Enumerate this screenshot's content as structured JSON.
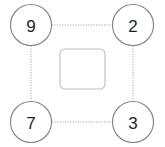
{
  "canvas": {
    "width": 165,
    "height": 147,
    "background": "#ffffff"
  },
  "diagram": {
    "type": "node-link-diagram",
    "title": "",
    "layout": "four-corner-ring",
    "colors": {
      "node_stroke": "#808080",
      "node_fill": "#ffffff",
      "node_text": "#1f1f1f",
      "edge_stroke": "#9a9a9a",
      "center_box_stroke": "#bdbdbd",
      "center_box_fill": "#ffffff"
    },
    "nodes": [
      {
        "id": "node-top-left",
        "label": "9",
        "position": "top-left",
        "cx": 31,
        "cy": 25,
        "r": 20.5
      },
      {
        "id": "node-top-right",
        "label": "2",
        "position": "top-right",
        "cx": 133,
        "cy": 25,
        "r": 20.5
      },
      {
        "id": "node-bottom-left",
        "label": "7",
        "position": "bottom-left",
        "cx": 31,
        "cy": 122,
        "r": 20.5
      },
      {
        "id": "node-bottom-right",
        "label": "3",
        "position": "bottom-right",
        "cx": 133,
        "cy": 122,
        "r": 20.5
      }
    ],
    "edges": [
      {
        "id": "edge-top",
        "from": "node-top-left",
        "to": "node-top-right",
        "style": "dotted",
        "x1": 52,
        "y1": 25,
        "x2": 112,
        "y2": 25
      },
      {
        "id": "edge-bottom",
        "from": "node-bottom-left",
        "to": "node-bottom-right",
        "style": "dotted",
        "x1": 52,
        "y1": 122,
        "x2": 112,
        "y2": 122
      },
      {
        "id": "edge-left",
        "from": "node-top-left",
        "to": "node-bottom-left",
        "style": "dotted",
        "x1": 31,
        "y1": 46,
        "x2": 31,
        "y2": 101
      },
      {
        "id": "edge-right",
        "from": "node-top-right",
        "to": "node-bottom-right",
        "style": "dotted",
        "x1": 133,
        "y1": 46,
        "x2": 133,
        "y2": 101
      }
    ],
    "center_box": {
      "id": "center-box",
      "label": "",
      "x": 60,
      "y": 49,
      "width": 45,
      "height": 40,
      "rx": 5
    }
  }
}
